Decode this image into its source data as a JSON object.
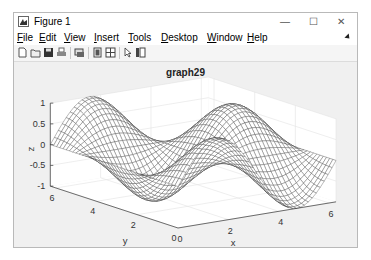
{
  "window": {
    "title": "Figure 1",
    "controls": {
      "minimize": "—",
      "maximize": "☐",
      "close": "✕"
    }
  },
  "menubar": {
    "items": [
      {
        "label": "File",
        "accel": "F",
        "rest": "ile"
      },
      {
        "label": "Edit",
        "accel": "E",
        "rest": "dit"
      },
      {
        "label": "View",
        "accel": "V",
        "rest": "iew"
      },
      {
        "label": "Insert",
        "accel": "I",
        "rest": "nsert"
      },
      {
        "label": "Tools",
        "accel": "T",
        "rest": "ools"
      },
      {
        "label": "Desktop",
        "accel": "D",
        "rest": "esktop"
      },
      {
        "label": "Window",
        "accel": "W",
        "rest": "indow"
      },
      {
        "label": "Help",
        "accel": "H",
        "rest": "elp"
      }
    ]
  },
  "toolbar": {
    "buttons": [
      "new-figure",
      "open-file",
      "save",
      "print",
      "link-plot",
      "hide-plot-tools",
      "show-plot-tools",
      "edit-plot",
      "insert-colorbar"
    ]
  },
  "chart_data": {
    "type": "surface-mesh",
    "title": "graph29",
    "xlabel": "x",
    "ylabel": "y",
    "zlabel": "z",
    "xlim": [
      0,
      6.28
    ],
    "ylim": [
      0,
      6.28
    ],
    "zlim": [
      -1,
      1
    ],
    "xticks": [
      "0",
      "2",
      "4",
      "6"
    ],
    "yticks": [
      "0",
      "2",
      "4",
      "6"
    ],
    "zticks": [
      "-1",
      "-0.5",
      "0",
      "0.5",
      "1"
    ],
    "grid": true,
    "function": "z = sin(x) * cos(y)",
    "mesh_color": "#3a3a3a",
    "face_color": "#ffffff"
  }
}
